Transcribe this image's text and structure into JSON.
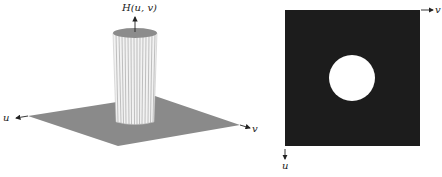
{
  "left_panel": {
    "type": "3d-surface-plot",
    "z_axis_label": "H(u, v)",
    "u_axis_label": "u",
    "v_axis_label": "v",
    "description": "Ideal lowpass filter transfer function: cylinder on a flat plane"
  },
  "right_panel": {
    "type": "image-display",
    "u_axis_label": "u",
    "v_axis_label": "v",
    "description": "Filter displayed as an image: white disk on black square"
  },
  "colors": {
    "plane": "#8a8a8a",
    "cylinder_top": "#8c8c8c",
    "cylinder_side": "#f2f2f2",
    "square": "#1c1c1c",
    "disk": "#ffffff",
    "axis": "#222222"
  }
}
